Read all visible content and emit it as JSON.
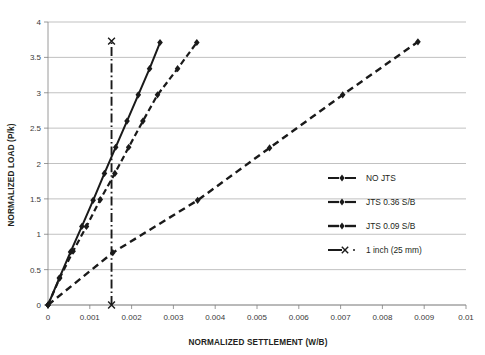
{
  "chart_data": {
    "type": "line",
    "title": "",
    "xlabel": "NORMALIZED SETTLEMENT (W/B)",
    "ylabel": "NORMALIZED LOAD (P/k)",
    "xlim": [
      0,
      0.01
    ],
    "ylim": [
      0,
      4
    ],
    "xticks": [
      "0",
      "0.001",
      "0.002",
      "0.003",
      "0.004",
      "0.005",
      "0.006",
      "0.007",
      "0.008",
      "0.009",
      "0.01"
    ],
    "xtick_values": [
      0,
      0.001,
      0.002,
      0.003,
      0.004,
      0.005,
      0.006,
      0.007,
      0.008,
      0.009,
      0.01
    ],
    "yticks": [
      "0",
      "0.5",
      "1",
      "1.5",
      "2",
      "2.5",
      "3",
      "3.5",
      "4"
    ],
    "ytick_values": [
      0,
      0.5,
      1,
      1.5,
      2,
      2.5,
      3,
      3.5,
      4
    ],
    "grid": "horizontal",
    "legend_position": "right-middle",
    "series": [
      {
        "name": "NO JTS",
        "style": "solid",
        "marker": "diamond",
        "color": "#1a1a1a",
        "points": [
          [
            0.0,
            0.0
          ],
          [
            0.00027,
            0.38
          ],
          [
            0.00054,
            0.75
          ],
          [
            0.00081,
            1.11
          ],
          [
            0.00108,
            1.48
          ],
          [
            0.00135,
            1.86
          ],
          [
            0.00162,
            2.23
          ],
          [
            0.00189,
            2.6
          ],
          [
            0.00216,
            2.97
          ],
          [
            0.00243,
            3.34
          ],
          [
            0.00268,
            3.71
          ]
        ]
      },
      {
        "name": "JTS 0.36 S/B",
        "style": "dashed",
        "marker": "diamond",
        "color": "#1a1a1a",
        "points": [
          [
            0.0,
            0.0
          ],
          [
            0.00028,
            0.38
          ],
          [
            0.0006,
            0.76
          ],
          [
            0.00092,
            1.11
          ],
          [
            0.00125,
            1.49
          ],
          [
            0.0016,
            1.86
          ],
          [
            0.00193,
            2.23
          ],
          [
            0.00227,
            2.6
          ],
          [
            0.00262,
            2.97
          ],
          [
            0.0031,
            3.34
          ],
          [
            0.00356,
            3.71
          ]
        ]
      },
      {
        "name": "JTS 0.09 S/B",
        "style": "dashed-long",
        "marker": "diamond",
        "color": "#1a1a1a",
        "points": [
          [
            0.0,
            0.0
          ],
          [
            0.00155,
            0.74
          ],
          [
            0.00358,
            1.48
          ],
          [
            0.0053,
            2.22
          ],
          [
            0.00705,
            2.97
          ],
          [
            0.00885,
            3.72
          ]
        ]
      },
      {
        "name": "1 inch (25 mm)",
        "style": "dash-dot",
        "marker": "cross",
        "color": "#1a1a1a",
        "points": [
          [
            0.00152,
            0.0
          ],
          [
            0.00152,
            3.73
          ]
        ]
      }
    ]
  },
  "legend": {
    "items": [
      {
        "label": "NO JTS",
        "style": "solid",
        "marker": "diamond"
      },
      {
        "label": "JTS 0.36 S/B",
        "style": "dashed",
        "marker": "diamond"
      },
      {
        "label": "JTS 0.09 S/B",
        "style": "dashed-long",
        "marker": "diamond"
      },
      {
        "label": "1 inch (25 mm)",
        "style": "dash-dot",
        "marker": "cross"
      }
    ]
  },
  "colors": {
    "ink": "#1a1a1a",
    "grid": "#a6a6a6",
    "axis": "#808080",
    "background": "#ffffff"
  }
}
